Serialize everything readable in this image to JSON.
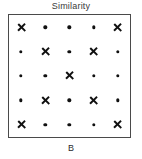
{
  "figure": {
    "title": "Similarity",
    "panel_label": "B",
    "marker_color": "#111111",
    "border_color": "#4a4a4a",
    "background_color": "#ffffff",
    "title_color": "#3a3a3a"
  },
  "chart_data": {
    "type": "scatter",
    "title": "Similarity",
    "subtitle": "",
    "xlabel": "",
    "ylabel": "",
    "annotations": [
      "B"
    ],
    "legend": [],
    "grid": false,
    "axis_ticks": false,
    "xlim": [
      0,
      5
    ],
    "ylim": [
      0,
      5
    ],
    "rows": 5,
    "cols": 5,
    "marker_types": [
      "cross",
      "dot"
    ],
    "matrix": [
      [
        "cross",
        "dot",
        "dot",
        "dot",
        "cross"
      ],
      [
        "dot",
        "cross",
        "dot",
        "cross",
        "dot"
      ],
      [
        "dot",
        "dot",
        "cross",
        "dot",
        "dot"
      ],
      [
        "dot",
        "cross",
        "dot",
        "cross",
        "dot"
      ],
      [
        "cross",
        "dot",
        "dot",
        "dot",
        "cross"
      ]
    ],
    "series": [
      {
        "name": "cross",
        "marker": "x",
        "points": [
          [
            1,
            5
          ],
          [
            5,
            5
          ],
          [
            2,
            4
          ],
          [
            4,
            4
          ],
          [
            3,
            3
          ],
          [
            2,
            2
          ],
          [
            4,
            2
          ],
          [
            1,
            1
          ],
          [
            5,
            1
          ]
        ]
      },
      {
        "name": "dot",
        "marker": "circle",
        "points": [
          [
            2,
            5
          ],
          [
            3,
            5
          ],
          [
            4,
            5
          ],
          [
            1,
            4
          ],
          [
            3,
            4
          ],
          [
            5,
            4
          ],
          [
            1,
            3
          ],
          [
            2,
            3
          ],
          [
            4,
            3
          ],
          [
            5,
            3
          ],
          [
            1,
            2
          ],
          [
            3,
            2
          ],
          [
            5,
            2
          ],
          [
            2,
            1
          ],
          [
            3,
            1
          ],
          [
            4,
            1
          ]
        ]
      }
    ]
  }
}
